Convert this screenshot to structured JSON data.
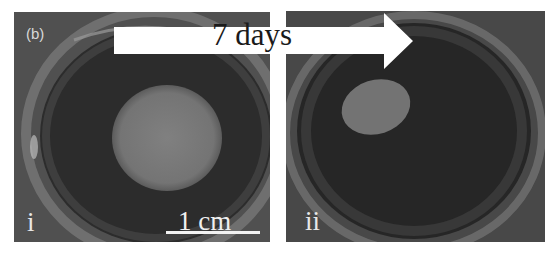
{
  "figure": {
    "label": "(b)",
    "arrow": {
      "text": "7 days",
      "direction": "right",
      "fill": "#ffffff"
    },
    "panels": [
      {
        "id": "i",
        "label": "i",
        "description": "Petri dish with large round grey disc, day 0",
        "scale_bar": {
          "text": "1 cm"
        }
      },
      {
        "id": "ii",
        "label": "ii",
        "description": "Petri dish with smaller oval grey disc after 7 days"
      }
    ],
    "colors": {
      "background_dark": "#2a2a2a",
      "dish_rim": "#6a6a6a",
      "disc": "#7a7a7a",
      "label_text": "#e8e8e8"
    }
  }
}
